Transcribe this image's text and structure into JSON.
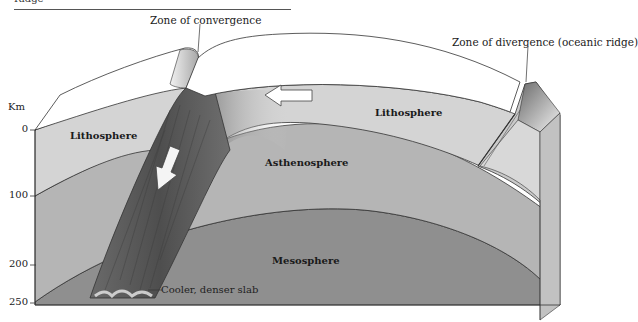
{
  "header": {
    "clipped_text": "Ridge"
  },
  "axis": {
    "unit": "Km",
    "ticks": [
      {
        "label": "0",
        "y": 129
      },
      {
        "label": "100",
        "y": 195
      },
      {
        "label": "200",
        "y": 265
      },
      {
        "label": "250",
        "y": 302
      }
    ]
  },
  "labels": {
    "zone_convergence": "Zone of convergence",
    "zone_divergence": "Zone of divergence (oceanic ridge)",
    "lithosphere_left": "Lithosphere",
    "lithosphere_right": "Lithosphere",
    "asthenosphere": "Asthenosphere",
    "mesosphere": "Mesosphere",
    "slab": "Cooler, denser slab"
  },
  "colors": {
    "top_surface": "#ffffff",
    "lithosphere": "#d4d4d4",
    "asthenosphere": "#b5b5b5",
    "mesosphere": "#8f8f8f",
    "slab": "#5e5e5e",
    "outline": "#333333"
  }
}
